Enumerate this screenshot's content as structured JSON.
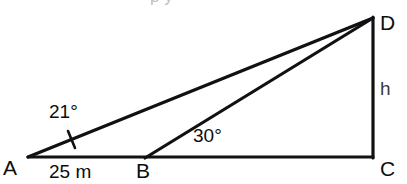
{
  "figure": {
    "kind": "geometry-diagram",
    "width": 407,
    "height": 184,
    "background_color": "#ffffff",
    "stroke_color": "#111111",
    "vertices": {
      "A": {
        "label": "A",
        "x": 28,
        "y": 157
      },
      "B": {
        "label": "B",
        "x": 145,
        "y": 158
      },
      "C": {
        "label": "C",
        "x": 373,
        "y": 157
      },
      "D": {
        "label": "D",
        "x": 373,
        "y": 17
      }
    },
    "segments": [
      {
        "name": "base-AC",
        "from": "A",
        "to": "C"
      },
      {
        "name": "hypotenuse-AD",
        "from": "A",
        "to": "D"
      },
      {
        "name": "cevian-BD",
        "from": "B",
        "to": "D"
      },
      {
        "name": "vertical-DC",
        "from": "D",
        "to": "C"
      }
    ],
    "angle_marks": [
      {
        "name": "angle-at-A",
        "value": "21°",
        "at_vertex": "A"
      },
      {
        "name": "angle-at-B",
        "value": "30°",
        "at_vertex": "B"
      }
    ],
    "tick_mark": {
      "name": "angle-tick-on-AD",
      "x": 72,
      "y": 139
    },
    "labels": {
      "vertex_a": "A",
      "vertex_b": "B",
      "vertex_c": "C",
      "vertex_d": "D",
      "angle_a": "21°",
      "angle_b": "30°",
      "base_length": "25 m",
      "height": "h"
    },
    "top_clipped_text": "p y"
  }
}
